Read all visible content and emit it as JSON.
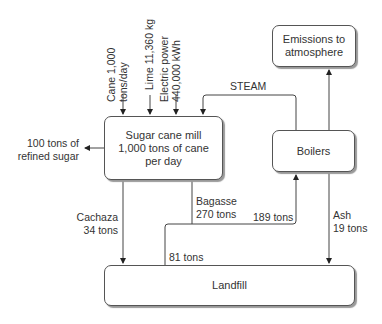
{
  "nodes": {
    "mill": {
      "line1": "Sugar cane mill",
      "line2": "1,000 tons of cane",
      "line3": "per day"
    },
    "boilers": {
      "label": "Boilers"
    },
    "emissions": {
      "line1": "Emissions to",
      "line2": "atmosphere"
    },
    "landfill": {
      "label": "Landfill"
    }
  },
  "inputs": {
    "cane": {
      "line1": "Cane 1,000",
      "line2": "tons/day"
    },
    "lime": {
      "line1": "Lime 11,360 kg"
    },
    "power": {
      "line1": "Electric power",
      "line2": "440,000 kWh"
    }
  },
  "flows": {
    "refined_sugar": {
      "line1": "100 tons of",
      "line2": "refined sugar"
    },
    "steam": "STEAM",
    "cachaza": {
      "line1": "Cachaza",
      "line2": "34 tons"
    },
    "bagasse": {
      "line1": "Bagasse",
      "line2": "270 tons"
    },
    "bagasse_to_boilers": "189 tons",
    "bagasse_to_landfill": "81 tons",
    "ash": {
      "line1": "Ash",
      "line2": "19 tons"
    }
  }
}
